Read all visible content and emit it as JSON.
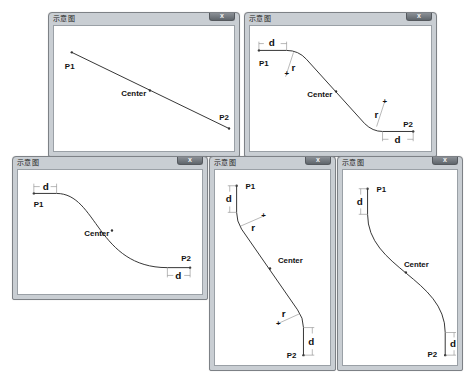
{
  "windows": [
    {
      "id": "straight",
      "title": "示意图",
      "close_label": "x",
      "labels": {
        "p1": "P1",
        "p2": "P2",
        "center": "Center"
      }
    },
    {
      "id": "arc-fillet-horizontal",
      "title": "示意图",
      "close_label": "x",
      "labels": {
        "p1": "P1",
        "p2": "P2",
        "center": "Center",
        "d_start": "d",
        "d_end": "d",
        "r_start": "r",
        "r_end": "r"
      }
    },
    {
      "id": "s-curve-horizontal",
      "title": "示意图",
      "close_label": "x",
      "labels": {
        "p1": "P1",
        "p2": "P2",
        "center": "Center",
        "d_start": "d",
        "d_end": "d"
      }
    },
    {
      "id": "arc-fillet-vertical",
      "title": "示意图",
      "close_label": "x",
      "labels": {
        "p1": "P1",
        "p2": "P2",
        "center": "Center",
        "d_start": "d",
        "d_end": "d",
        "r_start": "r",
        "r_end": "r"
      }
    },
    {
      "id": "s-curve-vertical",
      "title": "示意图",
      "close_label": "x",
      "labels": {
        "p1": "P1",
        "p2": "P2",
        "center": "Center",
        "d_start": "d",
        "d_end": "d"
      }
    }
  ]
}
